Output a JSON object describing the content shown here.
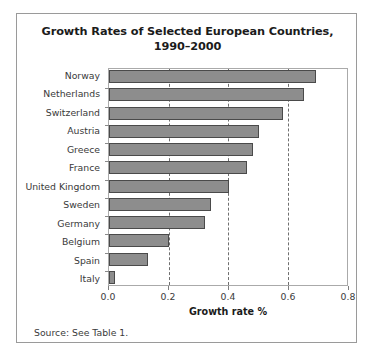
{
  "figure": {
    "title_line1": "Growth Rates of Selected European Countries,",
    "title_line2": "1990–2000",
    "source_note": "Source: See Table 1."
  },
  "chart_data": {
    "type": "bar",
    "orientation": "horizontal",
    "title": "Growth Rates of Selected European Countries, 1990–2000",
    "xlabel": "Growth rate %",
    "ylabel": "",
    "categories": [
      "Norway",
      "Netherlands",
      "Switzerland",
      "Austria",
      "Greece",
      "France",
      "United Kingdom",
      "Sweden",
      "Germany",
      "Belgium",
      "Spain",
      "Italy"
    ],
    "values": [
      0.69,
      0.65,
      0.58,
      0.5,
      0.48,
      0.46,
      0.4,
      0.34,
      0.32,
      0.2,
      0.13,
      0.02
    ],
    "xlim": [
      0.0,
      0.8
    ],
    "xticks": [
      0.0,
      0.2,
      0.4,
      0.6,
      0.8
    ],
    "xticklabels": [
      "0.0",
      "0.2",
      "0.4",
      "0.6",
      "0.8"
    ],
    "gridlines": [
      0.2,
      0.4,
      0.6
    ],
    "grid": true,
    "grid_style": "dashed-vertical",
    "legend": null,
    "bar_color": "#8d8d8d",
    "bar_edge_color": "#4a4a4a"
  }
}
